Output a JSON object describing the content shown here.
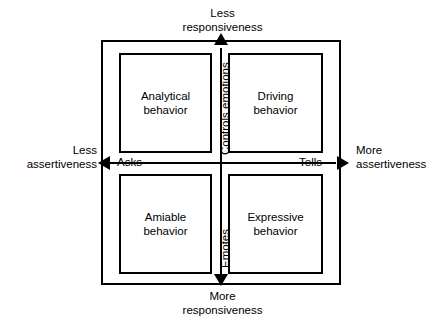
{
  "diagram": {
    "axes": {
      "vertical": {
        "top_label": "Less\nresponsiveness",
        "bottom_label": "More\nresponsiveness",
        "upper_pole": "Controls emotions",
        "lower_pole": "Emotes"
      },
      "horizontal": {
        "left_label": "Less\nassertiveness",
        "right_label": "More\nassertiveness",
        "left_pole": "Asks",
        "right_pole": "Tells"
      }
    },
    "quadrants": [
      {
        "id": "analytical",
        "label": "Analytical\nbehavior",
        "position": "top-left"
      },
      {
        "id": "driving",
        "label": "Driving\nbehavior",
        "position": "top-right"
      },
      {
        "id": "amiable",
        "label": "Amiable\nbehavior",
        "position": "bottom-left"
      },
      {
        "id": "expressive",
        "label": "Expressive\nbehavior",
        "position": "bottom-right"
      }
    ],
    "colors": {
      "stroke": "#000000",
      "background": "#ffffff",
      "text": "#000000"
    },
    "icons": {
      "arrow_up": "arrow-up-icon",
      "arrow_down": "arrow-down-icon",
      "arrow_left": "arrow-left-icon",
      "arrow_right": "arrow-right-icon"
    }
  }
}
